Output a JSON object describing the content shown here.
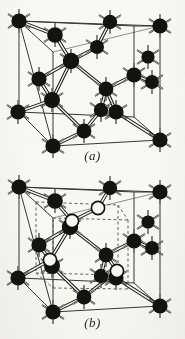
{
  "figure": {
    "type": "crystal-structure-diagram",
    "background_color": "#fbfaf7",
    "ink_color": "#1a1a18",
    "panel_count": 2
  },
  "panels": [
    {
      "id": "a",
      "caption": "(a)",
      "structure_name": "diamond cubic lattice",
      "atom_types": [
        {
          "key": "dark",
          "label": "dark atom",
          "fill": "#15130f",
          "stroke": "#000000",
          "radius": 7.2,
          "count": 18
        }
      ],
      "cube": {
        "stroke": "#3a3732",
        "stroke_width": 1.0,
        "front_bottom_left": [
          18,
          128
        ],
        "front_bottom_right": [
          152,
          128
        ],
        "front_top_left": [
          18,
          34
        ],
        "front_top_right": [
          152,
          34
        ],
        "depth_dx": -14,
        "depth_dy": -22
      },
      "bond": {
        "stroke": "#111111",
        "stroke_width": 1.0,
        "inner_stroke": "#f4f2ee",
        "inner_width": 1.7
      },
      "atoms": [
        {
          "id": "a-c1",
          "type": "dark",
          "x": 19,
          "y": 21,
          "r": 7.6,
          "spikes": 6
        },
        {
          "id": "a-c2",
          "type": "dark",
          "x": 110,
          "y": 22,
          "r": 7.2,
          "spikes": 5
        },
        {
          "id": "a-c3",
          "type": "dark",
          "x": 160,
          "y": 26,
          "r": 7.6,
          "spikes": 6
        },
        {
          "id": "a-c4",
          "type": "dark",
          "x": 55,
          "y": 35,
          "r": 7.8,
          "spikes": 6
        },
        {
          "id": "a-c5",
          "type": "dark",
          "x": 97,
          "y": 47,
          "r": 7.0,
          "spikes": 4
        },
        {
          "id": "a-c6",
          "type": "dark",
          "x": 71,
          "y": 61,
          "r": 8.2,
          "spikes": 6
        },
        {
          "id": "a-c7",
          "type": "dark",
          "x": 134,
          "y": 75,
          "r": 7.6,
          "spikes": 5
        },
        {
          "id": "a-c8",
          "type": "dark",
          "x": 39,
          "y": 79,
          "r": 7.6,
          "spikes": 5
        },
        {
          "id": "a-c9",
          "type": "dark",
          "x": 106,
          "y": 89,
          "r": 7.4,
          "spikes": 5
        },
        {
          "id": "a-c10",
          "type": "dark",
          "x": 52,
          "y": 100,
          "r": 8.0,
          "spikes": 6
        },
        {
          "id": "a-c11",
          "type": "dark",
          "x": 116,
          "y": 112,
          "r": 7.6,
          "spikes": 5
        },
        {
          "id": "a-c12",
          "type": "dark",
          "x": 101,
          "y": 110,
          "r": 7.2,
          "spikes": 4
        },
        {
          "id": "a-c13",
          "type": "dark",
          "x": 18,
          "y": 112,
          "r": 7.6,
          "spikes": 6
        },
        {
          "id": "a-c14",
          "type": "dark",
          "x": 84,
          "y": 131,
          "r": 7.4,
          "spikes": 5
        },
        {
          "id": "a-c15",
          "type": "dark",
          "x": 53,
          "y": 146,
          "r": 7.6,
          "spikes": 6
        },
        {
          "id": "a-c16",
          "type": "dark",
          "x": 160,
          "y": 140,
          "r": 7.6,
          "spikes": 6
        },
        {
          "id": "a-c17",
          "type": "dark",
          "x": 152,
          "y": 82,
          "r": 7.0,
          "spikes": 4
        },
        {
          "id": "a-c18",
          "type": "dark",
          "x": 148,
          "y": 56,
          "r": 6.6,
          "spikes": 4
        }
      ],
      "bonds": [
        [
          "a-c4",
          "a-c6"
        ],
        [
          "a-c5",
          "a-c6"
        ],
        [
          "a-c6",
          "a-c8"
        ],
        [
          "a-c6",
          "a-c9"
        ],
        [
          "a-c9",
          "a-c7"
        ],
        [
          "a-c9",
          "a-c11"
        ],
        [
          "a-c9",
          "a-c12"
        ],
        [
          "a-c8",
          "a-c10"
        ],
        [
          "a-c10",
          "a-c13"
        ],
        [
          "a-c10",
          "a-c14"
        ],
        [
          "a-c10",
          "a-c6"
        ],
        [
          "a-c11",
          "a-c16"
        ],
        [
          "a-c12",
          "a-c14"
        ],
        [
          "a-c14",
          "a-c15"
        ],
        [
          "a-c7",
          "a-c17"
        ],
        [
          "a-c5",
          "a-c2"
        ],
        [
          "a-c4",
          "a-c1"
        ]
      ]
    },
    {
      "id": "b",
      "caption": "(b)",
      "structure_name": "zincblende / two-atom basis lattice",
      "atom_types": [
        {
          "key": "dark",
          "label": "dark atom",
          "fill": "#15130f",
          "stroke": "#000000",
          "radius": 7.2,
          "count": 17
        },
        {
          "key": "open",
          "label": "open atom",
          "fill": "#fbfaf7",
          "stroke": "#101010",
          "radius": 6.4,
          "count": 4
        }
      ],
      "cube": {
        "stroke": "#3a3732",
        "stroke_width": 1.0,
        "front_bottom_left": [
          18,
          129
        ],
        "front_bottom_right": [
          152,
          129
        ],
        "front_top_left": [
          18,
          35
        ],
        "front_top_right": [
          152,
          35
        ],
        "depth_dx": -14,
        "depth_dy": -22
      },
      "inner_cube": {
        "stroke": "#55514a",
        "stroke_width": 0.9,
        "dash": "3,2.5",
        "note": "dashed sub-cube (octant) showing tetrahedral coordination"
      },
      "bond": {
        "stroke": "#111111",
        "stroke_width": 1.0,
        "inner_stroke": "#f4f2ee",
        "inner_width": 1.7
      },
      "atoms": [
        {
          "id": "b-c1",
          "type": "dark",
          "x": 19,
          "y": 22,
          "r": 7.6,
          "spikes": 6
        },
        {
          "id": "b-c2",
          "type": "dark",
          "x": 110,
          "y": 23,
          "r": 7.2,
          "spikes": 5
        },
        {
          "id": "b-c3",
          "type": "dark",
          "x": 160,
          "y": 27,
          "r": 7.6,
          "spikes": 6
        },
        {
          "id": "b-c4",
          "type": "dark",
          "x": 55,
          "y": 36,
          "r": 7.8,
          "spikes": 6
        },
        {
          "id": "b-o1",
          "type": "open",
          "x": 98,
          "y": 43,
          "r": 6.6,
          "spikes": 0
        },
        {
          "id": "b-o2",
          "type": "open",
          "x": 72,
          "y": 56,
          "r": 6.6,
          "spikes": 0
        },
        {
          "id": "b-c6",
          "type": "dark",
          "x": 70,
          "y": 62,
          "r": 8.2,
          "spikes": 6
        },
        {
          "id": "b-c7",
          "type": "dark",
          "x": 134,
          "y": 76,
          "r": 7.6,
          "spikes": 5
        },
        {
          "id": "b-c8",
          "type": "dark",
          "x": 39,
          "y": 80,
          "r": 7.6,
          "spikes": 5
        },
        {
          "id": "b-c9",
          "type": "dark",
          "x": 106,
          "y": 90,
          "r": 7.4,
          "spikes": 5
        },
        {
          "id": "b-o3",
          "type": "open",
          "x": 50,
          "y": 95,
          "r": 6.6,
          "spikes": 0
        },
        {
          "id": "b-c10",
          "type": "dark",
          "x": 52,
          "y": 101,
          "r": 8.0,
          "spikes": 6
        },
        {
          "id": "b-o4",
          "type": "open",
          "x": 117,
          "y": 106,
          "r": 6.6,
          "spikes": 0
        },
        {
          "id": "b-c11",
          "type": "dark",
          "x": 116,
          "y": 113,
          "r": 7.6,
          "spikes": 5
        },
        {
          "id": "b-c13",
          "type": "dark",
          "x": 18,
          "y": 113,
          "r": 7.6,
          "spikes": 6
        },
        {
          "id": "b-c14",
          "type": "dark",
          "x": 84,
          "y": 132,
          "r": 7.4,
          "spikes": 5
        },
        {
          "id": "b-c15",
          "type": "dark",
          "x": 53,
          "y": 147,
          "r": 7.6,
          "spikes": 6
        },
        {
          "id": "b-c16",
          "type": "dark",
          "x": 160,
          "y": 141,
          "r": 7.6,
          "spikes": 6
        },
        {
          "id": "b-c17",
          "type": "dark",
          "x": 152,
          "y": 83,
          "r": 7.0,
          "spikes": 4
        },
        {
          "id": "b-c18",
          "type": "dark",
          "x": 148,
          "y": 57,
          "r": 6.6,
          "spikes": 4
        },
        {
          "id": "b-c19",
          "type": "dark",
          "x": 101,
          "y": 111,
          "r": 7.2,
          "spikes": 4
        }
      ],
      "bonds": [
        [
          "b-c4",
          "b-o2"
        ],
        [
          "b-o1",
          "b-o2"
        ],
        [
          "b-o2",
          "b-c6"
        ],
        [
          "b-c6",
          "b-c8"
        ],
        [
          "b-c6",
          "b-c9"
        ],
        [
          "b-c6",
          "b-o3"
        ],
        [
          "b-c9",
          "b-c7"
        ],
        [
          "b-c9",
          "b-o4"
        ],
        [
          "b-c9",
          "b-c19"
        ],
        [
          "b-o4",
          "b-c11"
        ],
        [
          "b-o4",
          "b-c14"
        ],
        [
          "b-c8",
          "b-o3"
        ],
        [
          "b-o3",
          "b-c13"
        ],
        [
          "b-o3",
          "b-c10"
        ],
        [
          "b-c10",
          "b-c14"
        ],
        [
          "b-c11",
          "b-c16"
        ],
        [
          "b-c14",
          "b-c15"
        ],
        [
          "b-c7",
          "b-c17"
        ],
        [
          "b-o1",
          "b-c2"
        ],
        [
          "b-c4",
          "b-c1"
        ]
      ]
    }
  ],
  "captions": {
    "a": "(a)",
    "b": "(b)"
  }
}
